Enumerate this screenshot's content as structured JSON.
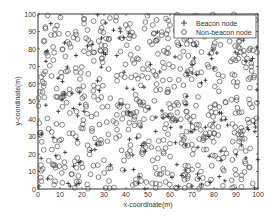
{
  "chart_data": {
    "type": "scatter",
    "title": "",
    "xlabel": "x-coordinate(m)",
    "ylabel": "y-coordinate(m)",
    "xlim": [
      0,
      100
    ],
    "ylim": [
      0,
      100
    ],
    "xticks": [
      0,
      10,
      20,
      30,
      40,
      50,
      60,
      70,
      80,
      90,
      100
    ],
    "yticks": [
      0,
      10,
      20,
      30,
      40,
      50,
      60,
      70,
      80,
      90,
      100
    ],
    "grid": false,
    "legend_position": "upper right",
    "series": [
      {
        "name": "Beacon node",
        "marker": "+",
        "approx_count": 160,
        "distribution": "uniform random over 100x100 m area"
      },
      {
        "name": "Non-beacon node",
        "marker": "o",
        "approx_count": 600,
        "distribution": "uniform random over 100x100 m area"
      }
    ]
  },
  "legend": {
    "beacon_label": "Beacon node",
    "nonbeacon_label": "Non-beacon node"
  },
  "colors": {
    "marker": "#555555",
    "axis": "#333333"
  }
}
